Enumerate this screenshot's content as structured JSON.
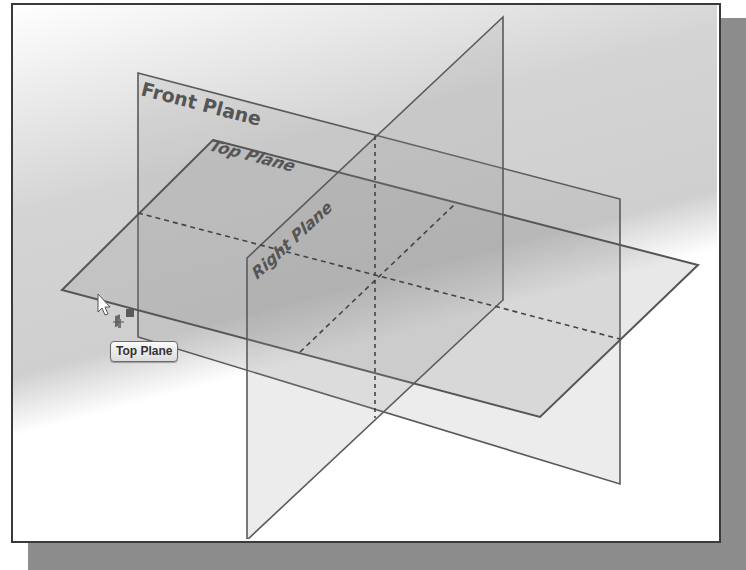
{
  "viewport": {
    "background_gradient": [
      "#ffffff",
      "#cfcfcf",
      "#ffffff"
    ],
    "frame_border_color": "#3a3a3a",
    "shadow_color": "#8c8c8c"
  },
  "planes": [
    {
      "name": "Front Plane",
      "label": "Front Plane",
      "corners": [
        [
          138,
          73
        ],
        [
          620,
          199
        ],
        [
          620,
          484
        ],
        [
          138,
          337
        ]
      ]
    },
    {
      "name": "Top Plane",
      "label": "Top Plane",
      "corners": [
        [
          213,
          140
        ],
        [
          698,
          265
        ],
        [
          540,
          417
        ],
        [
          62,
          290
        ]
      ]
    },
    {
      "name": "Right Plane",
      "label": "Right Plane",
      "corners": [
        [
          503,
          17
        ],
        [
          503,
          300
        ],
        [
          247,
          540
        ],
        [
          247,
          258
        ]
      ]
    }
  ],
  "edge_color": "#555555",
  "cursor": {
    "type": "arrow-pointer",
    "x": 98,
    "y": 295,
    "icon": "plane-select-icon"
  },
  "tooltip": {
    "text": "Top Plane"
  }
}
